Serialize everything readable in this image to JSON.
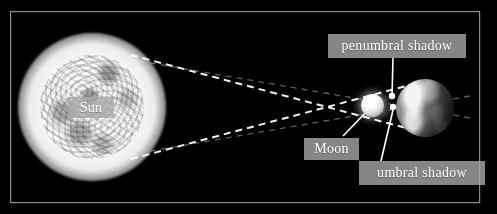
{
  "diagram": {
    "background_color": "#000000",
    "frame_color": "#8e8e8e",
    "label_box_color": "#a8a8a8",
    "label_text_color": "#ffffff",
    "ray_color": "#ffffff",
    "leader_color": "#ffffff"
  },
  "bodies": [
    {
      "key": "sun",
      "label": "Sun",
      "cx": 92,
      "cy": 107,
      "r": 52
    },
    {
      "key": "moon",
      "label": "Moon",
      "cx": 372,
      "cy": 105,
      "r": 11
    },
    {
      "key": "earth",
      "label": "Earth",
      "cx": 425,
      "cy": 108,
      "r": 29
    }
  ],
  "labels": {
    "sun": "Sun",
    "moon": "Moon",
    "penumbral_shadow": "penumbral shadow",
    "umbral_shadow": "umbral shadow"
  },
  "annotations": [
    {
      "name": "penumbral-shadow",
      "text": "penumbral shadow",
      "box": [
        328,
        34,
        138,
        24
      ],
      "leader_to": [
        392,
        96
      ]
    },
    {
      "name": "moon",
      "text": "Moon",
      "box": [
        304,
        138,
        55,
        22
      ],
      "leader_to": [
        372,
        105
      ]
    },
    {
      "name": "umbral-shadow",
      "text": "umbral shadow",
      "box": [
        359,
        161,
        126,
        24
      ],
      "leader_to": [
        393,
        107
      ]
    }
  ],
  "light_rays": {
    "count": 4,
    "style": "dashed",
    "description": "tangent light rays from Sun crossing at the Moon forming umbral and penumbral shadow cones"
  }
}
